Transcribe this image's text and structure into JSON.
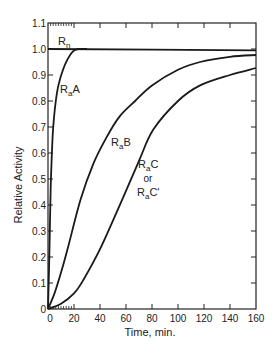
{
  "chart_data": {
    "type": "line",
    "title": "",
    "xlabel": "Time, min.",
    "ylabel": "Relative Activity",
    "xlim": [
      0,
      160
    ],
    "ylim": [
      0,
      1.1
    ],
    "x_ticks": [
      0,
      20,
      40,
      60,
      80,
      100,
      120,
      140,
      160
    ],
    "y_ticks": [
      0,
      0.1,
      0.2,
      0.3,
      0.4,
      0.5,
      0.6,
      0.7,
      0.8,
      0.9,
      1.0,
      1.1
    ],
    "x_tick_labels": [
      "0",
      "20",
      "40",
      "60",
      "80",
      "100",
      "120",
      "140",
      "160"
    ],
    "y_tick_labels": [
      "0",
      "0.1",
      "0.2",
      "0.3",
      "0.4",
      "0.5",
      "0.6",
      "0.7",
      "0.8",
      "0.9",
      "1.0",
      "1.1"
    ],
    "grid": false,
    "legend": "inline labels",
    "series": [
      {
        "name": "Rn",
        "label_main": "R",
        "label_sub": "n",
        "label_rest": "",
        "x": [
          0,
          160
        ],
        "y": [
          1.0,
          0.995
        ]
      },
      {
        "name": "RaA",
        "label_main": "R",
        "label_sub": "a",
        "label_rest": "A",
        "x": [
          0,
          1,
          2,
          3,
          4,
          6,
          8,
          11.5,
          15,
          19,
          23,
          30
        ],
        "y": [
          0,
          0.2,
          0.45,
          0.6,
          0.7,
          0.8,
          0.86,
          0.92,
          0.96,
          0.99,
          1.0,
          1.0
        ]
      },
      {
        "name": "RaB",
        "label_main": "R",
        "label_sub": "a",
        "label_rest": "B",
        "x": [
          0,
          5,
          10,
          15,
          25,
          35,
          45,
          55,
          67,
          80,
          100,
          117,
          140,
          160
        ],
        "y": [
          0,
          0.06,
          0.14,
          0.23,
          0.42,
          0.56,
          0.66,
          0.74,
          0.8,
          0.86,
          0.92,
          0.95,
          0.97,
          0.977
        ]
      },
      {
        "name": "RaC or RaC'",
        "label_main": "R",
        "label_sub": "a",
        "label_rest": "C",
        "label_or": "or",
        "label_alt": "C'",
        "x": [
          0,
          10,
          20,
          27,
          40,
          57,
          70,
          81,
          100,
          117,
          140,
          160
        ],
        "y": [
          0,
          0.02,
          0.06,
          0.11,
          0.23,
          0.42,
          0.57,
          0.69,
          0.8,
          0.86,
          0.9,
          0.927
        ]
      }
    ]
  }
}
